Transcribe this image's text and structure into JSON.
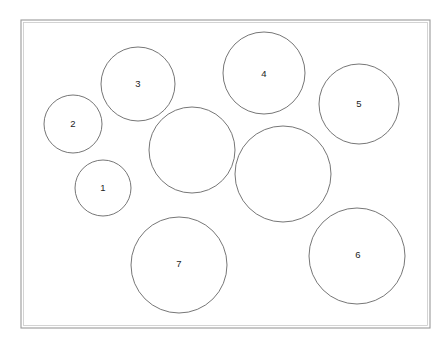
{
  "figure": {
    "background_color": "#ffffff",
    "frame": {
      "name": "bounding-rectangle",
      "x": 21,
      "y": 20,
      "width": 409,
      "height": 308,
      "stroke_color": "#9a9a9a",
      "fill": "none"
    },
    "circle_stroke_color": "#5d5d5d",
    "label_color": "#1d1d1d",
    "circles": [
      {
        "id": "circle-1",
        "label": "1",
        "cx": 103,
        "cy": 188,
        "r": 28,
        "labeled": true,
        "label_x": 103,
        "label_y": 188
      },
      {
        "id": "circle-2",
        "label": "2",
        "cx": 73,
        "cy": 124,
        "r": 29,
        "labeled": true,
        "label_x": 73,
        "label_y": 124
      },
      {
        "id": "circle-3",
        "label": "3",
        "cx": 138,
        "cy": 84,
        "r": 37,
        "labeled": true,
        "label_x": 138,
        "label_y": 84
      },
      {
        "id": "circle-4",
        "label": "4",
        "cx": 264,
        "cy": 73,
        "r": 41,
        "labeled": true,
        "label_x": 264,
        "label_y": 74
      },
      {
        "id": "circle-5",
        "label": "5",
        "cx": 359,
        "cy": 104,
        "r": 40,
        "labeled": true,
        "label_x": 359,
        "label_y": 104
      },
      {
        "id": "circle-6",
        "label": "6",
        "cx": 357,
        "cy": 256,
        "r": 48,
        "labeled": true,
        "label_x": 358,
        "label_y": 255
      },
      {
        "id": "circle-7",
        "label": "7",
        "cx": 179,
        "cy": 265,
        "r": 48,
        "labeled": true,
        "label_x": 179,
        "label_y": 264
      },
      {
        "id": "circle-unlabeled-a",
        "label": "",
        "cx": 192,
        "cy": 150,
        "r": 43,
        "labeled": false,
        "label_x": 192,
        "label_y": 150
      },
      {
        "id": "circle-unlabeled-b",
        "label": "",
        "cx": 283,
        "cy": 174,
        "r": 48,
        "labeled": false,
        "label_x": 283,
        "label_y": 174
      }
    ]
  }
}
